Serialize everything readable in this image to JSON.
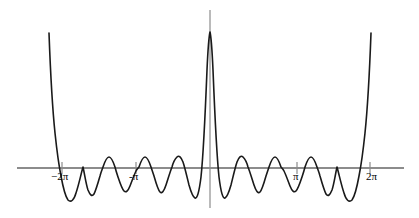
{
  "figure": {
    "kind": "function-plot",
    "background_color": "#ffffff",
    "curve_color": "#1a1a1a",
    "axis_color": "#8c8c8c",
    "tick_color": "#8c8c8c",
    "label_color": "#000000",
    "width": 419,
    "height": 218
  },
  "axes": {
    "x_axis_name": "x-axis",
    "y_axis_name": "y-axis",
    "x_axis_y_pixel": 168,
    "y_axis_x_pixel": 210,
    "x_axis_start_px": 17,
    "x_axis_end_px": 404,
    "y_axis_top_px": 10,
    "y_axis_bottom_px": 208,
    "ticks": [
      {
        "name": "tick-minus-two-pi",
        "label": "−2π",
        "x_px": 62,
        "label_x_px": 51,
        "label_y_px": 171
      },
      {
        "name": "tick-minus-pi",
        "label": "-π",
        "x_px": 136,
        "label_x_px": 129,
        "label_y_px": 171
      },
      {
        "name": "tick-pi",
        "label": "π",
        "x_px": 297,
        "label_x_px": 293,
        "label_y_px": 171
      },
      {
        "name": "tick-two-pi",
        "label": "2π",
        "x_px": 370,
        "label_x_px": 366,
        "label_y_px": 171
      }
    ]
  },
  "chart_data": {
    "type": "line",
    "title": "",
    "subtitle": "",
    "xlabel": "",
    "ylabel": "",
    "legend": [],
    "grid": false,
    "xlim": [
      -7.4,
      8.0
    ],
    "ylim": [
      -1.05,
      3.9
    ],
    "xtick_labels": [
      "−2π",
      "-π",
      "π",
      "2π"
    ],
    "xtick_values": [
      -6.283185,
      -3.141593,
      3.141593,
      6.283185
    ],
    "ytick_labels": [],
    "series": [
      {
        "name": "curve",
        "color": "#1a1a1a",
        "path": "M 49,33 C 50,60 52,104 55,133 C 57,152 59,166 61,176 C 63,187 65,196 68,200 C 71,203 74,200 76,193 C 79,184 81,174 83,167 C 85,176 86,184 88,190 C 90,195 92,197 94,194 C 96,190 98,183 100,176 C 101,172 102,170 103,167 C 105,161 107,157 109,157 C 111,157 113,161 115,167 C 116,171 117,174 118,177 C 120,183 122,189 124,191 C 126,193 128,191 130,186 C 132,181 134,175 136,171 C 137,169 138,168 139,167 C 141,161 143,157 145,157 C 147,157 149,161 151,167 C 152,170 153,173 154,176 C 156,183 158,190 160,192 C 162,194 164,191 166,185 C 168,179 170,172 172,167 C 173,163 175,159 177,157 C 179,155 181,157 183,162 C 185,168 187,177 189,185 C 191,192 193,197 195,198 C 197,199 199,193 201,177 C 203,158 205,120 207,70 C 208,48 209,36 210,32 C 211,36 212,48 213,70 C 215,120 217,158 219,177 C 221,193 223,199 225,198 C 227,197 229,192 231,185 C 233,177 235,168 237,162 C 239,157 241,155 243,157 C 245,159 247,163 248,167 C 250,172 252,179 254,185 C 256,191 258,194 260,192 C 262,190 264,183 266,176 C 267,173 268,170 269,167 C 271,161 273,157 275,157 C 277,157 279,161 281,167 C 282,168 283,169 284,171 C 286,175 288,181 290,186 C 292,191 294,193 296,191 C 298,189 300,183 302,177 C 303,174 304,171 305,167 C 307,161 309,157 311,157 C 313,157 315,161 317,167 C 318,170 319,172 320,176 C 322,183 324,190 326,194 C 328,197 330,195 332,190 C 334,184 335,176 337,167 C 339,174 341,184 344,193 C 346,200 349,203 352,200 C 355,196 357,187 359,176 C 361,166 363,152 365,133 C 368,104 370,60 371,33"
      }
    ],
    "key_points": {
      "central_peak": {
        "x_px": 210,
        "y_px": 32,
        "label": "central maximum"
      },
      "left_divergence_top": {
        "x_px": 49,
        "y_px": 33
      },
      "right_divergence_top": {
        "x_px": 371,
        "y_px": 33
      },
      "deepest_left_trough": {
        "x_px": 68,
        "y_px": 200
      },
      "deepest_right_trough": {
        "x_px": 352,
        "y_px": 200
      }
    }
  }
}
